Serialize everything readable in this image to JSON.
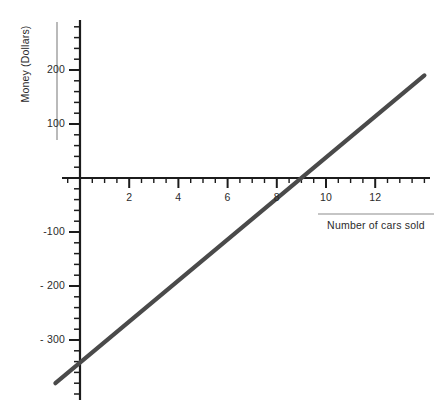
{
  "chart_data": {
    "type": "line",
    "title": "",
    "xlabel": "Number of cars sold",
    "ylabel": "Money (Dollars)",
    "xlim": [
      -1.2,
      14.4
    ],
    "ylim": [
      -410,
      290
    ],
    "grid": false,
    "legend": null,
    "x_ticks_major": [
      2,
      4,
      6,
      8,
      10,
      12
    ],
    "x_tick_labels": [
      "2",
      "4",
      "6",
      "8",
      "10",
      "12"
    ],
    "x_minor_tick_step": 0.5,
    "y_ticks_major": [
      200,
      100,
      -100,
      -200,
      -300
    ],
    "y_tick_labels": [
      "200",
      "100",
      "-100",
      "- 200",
      "- 300"
    ],
    "y_minor_tick_step": 20,
    "series": [
      {
        "name": "profit",
        "color": "#4a4a4a",
        "x": [
          -1,
          14
        ],
        "values": [
          -380,
          190
        ],
        "slope": 38,
        "intercept": -342,
        "x_intercept": 9
      }
    ],
    "axis_color": "#1c1c1c",
    "line_color": "#4a4a4a",
    "label_rule_color": "#8c8c8c"
  },
  "axes": {
    "y_title": "Money (Dollars)",
    "x_title": "Number of cars sold"
  },
  "y_labels": [
    {
      "text": "200",
      "value": 200
    },
    {
      "text": "100",
      "value": 100
    },
    {
      "text": "-100",
      "value": -100
    },
    {
      "text": "- 200",
      "value": -200
    },
    {
      "text": "- 300",
      "value": -300
    }
  ],
  "x_labels": [
    {
      "text": "2",
      "value": 2
    },
    {
      "text": "4",
      "value": 4
    },
    {
      "text": "6",
      "value": 6
    },
    {
      "text": "8",
      "value": 8
    },
    {
      "text": "10",
      "value": 10
    },
    {
      "text": "12",
      "value": 12
    }
  ]
}
